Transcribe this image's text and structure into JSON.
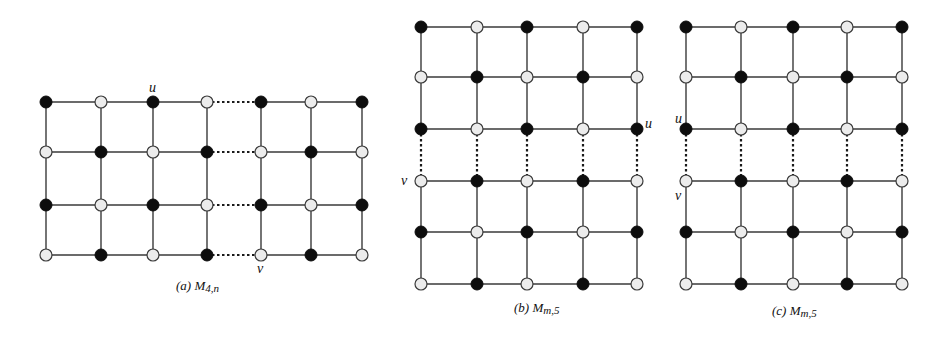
{
  "figure": {
    "panels": [
      {
        "id": "a",
        "caption": {
          "prefix": "(a)",
          "name": "M",
          "sub": "4,n",
          "x": 176,
          "y": 290
        },
        "cols": [
          46,
          101,
          153,
          207,
          261,
          311,
          362
        ],
        "rows": [
          102,
          152,
          205,
          255
        ],
        "colors": [
          [
            "B",
            "W",
            "B",
            "W",
            "B",
            "W",
            "B"
          ],
          [
            "W",
            "B",
            "W",
            "B",
            "W",
            "B",
            "W"
          ],
          [
            "B",
            "W",
            "B",
            "W",
            "B",
            "W",
            "B"
          ],
          [
            "W",
            "B",
            "W",
            "B",
            "W",
            "B",
            "W"
          ]
        ],
        "dashed": {
          "type": "horizontal",
          "between": [
            3,
            4
          ]
        },
        "labels": [
          {
            "text": "u",
            "x": 149,
            "y": 92
          },
          {
            "text": "v",
            "x": 257,
            "y": 273
          }
        ]
      },
      {
        "id": "b",
        "caption": {
          "prefix": "(b)",
          "name": "M",
          "sub": "m,5",
          "x": 514,
          "y": 312
        },
        "cols": [
          421,
          477,
          527,
          583,
          637
        ],
        "rows": [
          27,
          77,
          129,
          181,
          232,
          284
        ],
        "colors": [
          [
            "B",
            "W",
            "B",
            "W",
            "B"
          ],
          [
            "W",
            "B",
            "W",
            "B",
            "W"
          ],
          [
            "B",
            "W",
            "B",
            "W",
            "B"
          ],
          [
            "W",
            "B",
            "W",
            "B",
            "W"
          ],
          [
            "B",
            "W",
            "B",
            "W",
            "B"
          ],
          [
            "W",
            "B",
            "W",
            "B",
            "W"
          ]
        ],
        "dashed": {
          "type": "vertical",
          "between": [
            2,
            3
          ]
        },
        "labels": [
          {
            "text": "u",
            "x": 645,
            "y": 128
          },
          {
            "text": "v",
            "x": 401,
            "y": 185
          }
        ]
      },
      {
        "id": "c",
        "caption": {
          "prefix": "(c)",
          "name": "M",
          "sub": "m,5",
          "x": 772,
          "y": 315
        },
        "cols": [
          686,
          741,
          793,
          847,
          902
        ],
        "rows": [
          27,
          77,
          129,
          181,
          232,
          284
        ],
        "colors": [
          [
            "B",
            "W",
            "B",
            "W",
            "B"
          ],
          [
            "W",
            "B",
            "W",
            "B",
            "W"
          ],
          [
            "B",
            "W",
            "B",
            "W",
            "B"
          ],
          [
            "W",
            "B",
            "W",
            "B",
            "W"
          ],
          [
            "B",
            "W",
            "B",
            "W",
            "B"
          ],
          [
            "W",
            "B",
            "W",
            "B",
            "W"
          ]
        ],
        "dashed": {
          "type": "vertical",
          "between": [
            2,
            3
          ]
        },
        "labels": [
          {
            "text": "u",
            "x": 675,
            "y": 123
          },
          {
            "text": "v",
            "x": 675,
            "y": 200
          }
        ]
      }
    ],
    "node_radius": 6,
    "colors": {
      "black": "#0d0d0d",
      "white": "#ececec",
      "edge": "#3a3a3a"
    }
  }
}
